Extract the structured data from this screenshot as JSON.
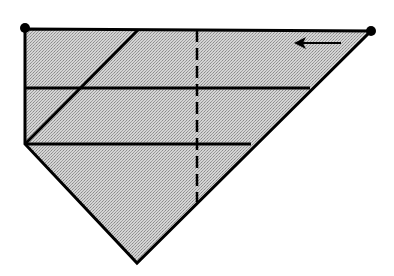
{
  "diagram": {
    "type": "origami-fold-diagram",
    "colors": {
      "background": "#ffffff",
      "fill": "#c8c8c8",
      "stroke": "#000000"
    },
    "shape": {
      "outline_points": [
        [
          25,
          29
        ],
        [
          371,
          31
        ],
        [
          137,
          263
        ],
        [
          25,
          144
        ]
      ],
      "description": "pentagon-like paper shape: flat top edge, vertical left edge, V-shaped bottom point"
    },
    "corner_dots": [
      {
        "name": "top-left-corner",
        "x": 25,
        "y": 28,
        "r": 5
      },
      {
        "name": "top-right-corner",
        "x": 371,
        "y": 31,
        "r": 5
      }
    ],
    "fold_lines": [
      {
        "name": "upper-horizontal-crease",
        "style": "solid",
        "x1": 25,
        "y1": 88,
        "x2": 310,
        "y2": 88
      },
      {
        "name": "lower-horizontal-crease",
        "style": "solid",
        "x1": 25,
        "y1": 144,
        "x2": 251,
        "y2": 144
      },
      {
        "name": "diagonal-crease",
        "style": "solid",
        "x1": 25,
        "y1": 144,
        "x2": 138,
        "y2": 30
      },
      {
        "name": "valley-fold-line",
        "style": "dashed",
        "x1": 197,
        "y1": 30,
        "x2": 197,
        "y2": 202
      }
    ],
    "arrows": [
      {
        "name": "move-left-arrow",
        "direction": "left",
        "x1": 341,
        "y1": 43,
        "x2": 294,
        "y2": 43
      }
    ]
  }
}
